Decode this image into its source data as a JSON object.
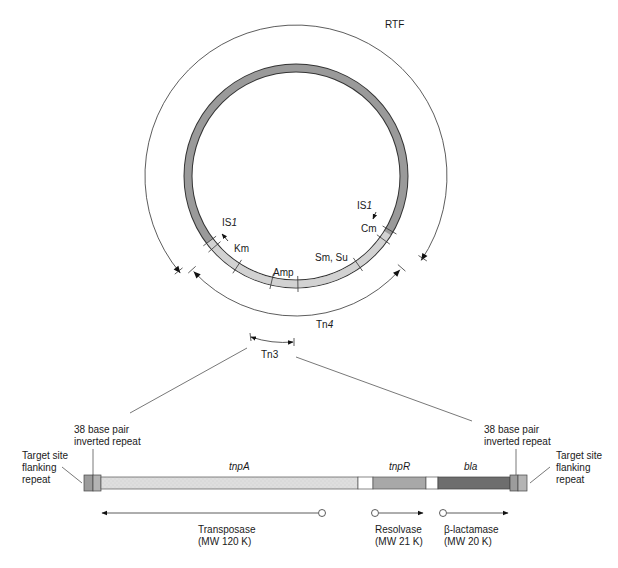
{
  "plasmid": {
    "name": "RTF",
    "markers": {
      "is1_left": "IS",
      "is1_left_num": "1",
      "km": "Km",
      "amp": "Amp",
      "sm_su": "Sm, Su",
      "cm": "Cm",
      "is1_right": "IS",
      "is1_right_num": "1"
    },
    "tn4": "Tn",
    "tn4_num": "4",
    "tn3": "Tn3"
  },
  "transposon": {
    "left_repeat_label": [
      "38 base pair",
      "inverted repeat"
    ],
    "right_repeat_label": [
      "38 base pair",
      "inverted repeat"
    ],
    "left_flank_label": [
      "Target site",
      "flanking",
      "repeat"
    ],
    "right_flank_label": [
      "Target site",
      "flanking",
      "repeat"
    ],
    "genes": [
      {
        "name": "tnpA",
        "protein": "Transposase",
        "mw": "(MW 120 K)",
        "direction": "left"
      },
      {
        "name": "tnpR",
        "protein": "Resolvase",
        "mw": "(MW 21 K)",
        "direction": "right"
      },
      {
        "name": "bla",
        "protein": "β-lactamase",
        "mw": "(MW 20 K)",
        "direction": "right"
      }
    ]
  },
  "colors": {
    "ring": "#9a9a9a",
    "ring_light": "#d2d2d2",
    "tnpA": "#dcdcdc",
    "tnpR": "#a8a8a8",
    "bla": "#6e6e6e",
    "repeat": "#9c9c9c",
    "line": "#333333"
  }
}
